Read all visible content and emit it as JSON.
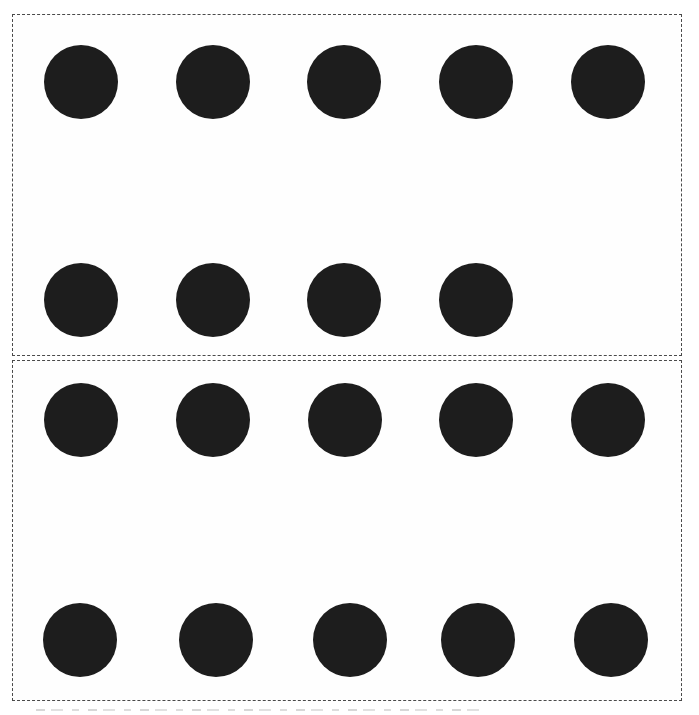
{
  "figure": {
    "background_color": "#ffffff",
    "panel_border_color": "#4a4a4a",
    "dot_color": "#1d1d1d",
    "dot_diameter": 74,
    "panels": [
      {
        "id": "panel-top",
        "x": 12,
        "y": 14,
        "width": 670,
        "height": 342,
        "dot_count": 9,
        "rows": [
          {
            "center_y": 82,
            "centers_x": [
              81,
              213,
              344,
              476,
              608
            ]
          },
          {
            "center_y": 300,
            "centers_x": [
              81,
              213,
              344,
              476
            ]
          }
        ]
      },
      {
        "id": "panel-bottom",
        "x": 12,
        "y": 360,
        "width": 670,
        "height": 341,
        "dot_count": 10,
        "rows": [
          {
            "center_y": 420,
            "centers_x": [
              81,
              213,
              345,
              476,
              608
            ]
          },
          {
            "center_y": 640,
            "centers_x": [
              80,
              216,
              350,
              478,
              611
            ]
          }
        ]
      }
    ]
  }
}
